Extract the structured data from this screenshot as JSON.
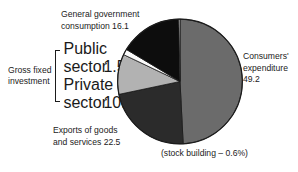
{
  "chart_data": {
    "type": "pie",
    "title": "",
    "subtitle": "",
    "xlabel": "",
    "ylabel": "",
    "legend_position": "callout-labels",
    "grid": false,
    "unit": "percent",
    "total": 100,
    "categories": [
      "Consumers' expenditure",
      "Exports of goods and services",
      "General government consumption",
      "Gross fixed investment - Private sector",
      "Gross fixed investment - Public sector",
      "stock building"
    ],
    "values": [
      49.2,
      22.5,
      16.1,
      10.4,
      1.5,
      -0.6
    ],
    "slices": [
      {
        "name": "consumers-expenditure",
        "label": "Consumers' expenditure",
        "value": 49.2,
        "value_text": "49.2",
        "color": "#6b6b6b",
        "start_angle": 0,
        "end_angle": 177.1
      },
      {
        "name": "exports-goods-services",
        "label": "Exports of goods and services",
        "value": 22.5,
        "value_text": "22.5",
        "color": "#2b2b2b",
        "start_angle": 177.1,
        "end_angle": 258.1
      },
      {
        "name": "private-sector-investment",
        "label": "Private sector",
        "value": 10.4,
        "value_text": "10.4",
        "color": "#b2b2b2",
        "start_angle": 258.1,
        "end_angle": 295.5
      },
      {
        "name": "public-sector-investment",
        "label": "Public sector",
        "value": 1.5,
        "value_text": "1.5",
        "color": "#fbfbfb",
        "start_angle": 295.5,
        "end_angle": 300.9
      },
      {
        "name": "general-government-consumption",
        "label": "General government consumption",
        "value": 16.1,
        "value_text": "16.1",
        "color": "#0d0d0d",
        "start_angle": 300.9,
        "end_angle": 358.9
      },
      {
        "name": "stock-building",
        "label": "stock building",
        "value": -0.6,
        "value_text": "- 0.6%",
        "color": "#ffffff",
        "start_angle": 358.9,
        "end_angle": 360
      }
    ],
    "annotations": [
      "(stock building – 0.6%)"
    ]
  },
  "labels": {
    "general_government": {
      "line1": "General government",
      "line2": "consumption 16.1"
    },
    "consumers": {
      "line1": "Consumers'",
      "line2": "expenditure",
      "line3": "49.2"
    },
    "exports": {
      "line1": "Exports of goods",
      "line2": "and services   22.5"
    },
    "stock_building": "(stock building – 0.6%)",
    "gross_fixed_investment": {
      "title_line1": "Gross fixed",
      "title_line2": "investment",
      "rows": [
        {
          "name_line1": "Public",
          "name_line2": "sector",
          "value": "1.5"
        },
        {
          "name_line1": "Private",
          "name_line2": "sector",
          "value": "10.4"
        }
      ]
    }
  },
  "colors": {
    "consumers": "#6b6b6b",
    "exports": "#2b2b2b",
    "government": "#0d0d0d",
    "private_sector": "#b2b2b2",
    "public_sector": "#fbfbfb",
    "stock_building": "#ffffff",
    "outline": "#1b1b1b",
    "background": "#ffffff"
  }
}
